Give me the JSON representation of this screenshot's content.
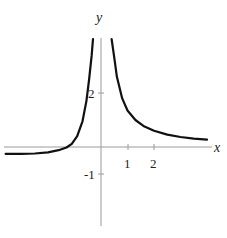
{
  "chart_data": {
    "type": "line",
    "title": "",
    "xlabel": "x",
    "ylabel": "y",
    "x_ticks": [
      1,
      2
    ],
    "y_ticks": [
      2,
      -1
    ],
    "tick_labels": {
      "x": [
        "1",
        "2"
      ],
      "y": [
        "2",
        "-1"
      ]
    },
    "xlim": [
      -3.7,
      4.2
    ],
    "ylim": [
      -2.9,
      4.0
    ],
    "grid": false,
    "legend": null,
    "series": [
      {
        "name": "left branch",
        "points": [
          [
            -3.6,
            -0.25
          ],
          [
            -3.0,
            -0.25
          ],
          [
            -2.5,
            -0.24
          ],
          [
            -2.0,
            -0.2
          ],
          [
            -1.6,
            -0.12
          ],
          [
            -1.3,
            -0.02
          ],
          [
            -1.1,
            0.12
          ],
          [
            -0.9,
            0.4
          ],
          [
            -0.7,
            0.95
          ],
          [
            -0.55,
            1.7
          ],
          [
            -0.45,
            2.5
          ],
          [
            -0.35,
            3.4
          ],
          [
            -0.3,
            4.0
          ]
        ]
      },
      {
        "name": "right branch",
        "points": [
          [
            0.4,
            4.0
          ],
          [
            0.5,
            3.3
          ],
          [
            0.6,
            2.6
          ],
          [
            0.8,
            1.8
          ],
          [
            1.0,
            1.35
          ],
          [
            1.3,
            1.0
          ],
          [
            1.6,
            0.78
          ],
          [
            2.0,
            0.6
          ],
          [
            2.5,
            0.46
          ],
          [
            3.0,
            0.37
          ],
          [
            3.5,
            0.31
          ],
          [
            4.0,
            0.27
          ]
        ]
      }
    ],
    "colors": {
      "curve": "#111111",
      "axis": "#9a9a9a"
    }
  },
  "labels": {
    "x_axis": "x",
    "y_axis": "y",
    "tick_x1": "1",
    "tick_x2": "2",
    "tick_y2": "2",
    "tick_ym1": "-1"
  }
}
